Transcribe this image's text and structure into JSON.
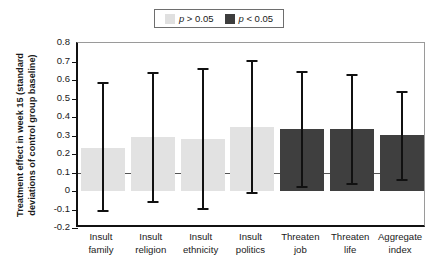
{
  "chart_data": {
    "type": "bar",
    "title": "",
    "xlabel": "",
    "ylabel": "Treatment effect in week 15 (standard deviations of control group baseline)",
    "ylabel_line1": "Treatment effect in week 15 (standard",
    "ylabel_line2": "deviations of control group baseline)",
    "ylim": [
      -0.2,
      0.8
    ],
    "yticks": [
      0.8,
      0.7,
      0.6,
      0.5,
      0.4,
      0.3,
      0.2,
      0.1,
      0,
      -0.1,
      -0.2
    ],
    "ytick_labels": [
      "0.8",
      "0.7",
      "0.6",
      "0.5",
      "0.4",
      "0.3",
      "0.2",
      "0.1",
      "0",
      "-0.1",
      "-0.2"
    ],
    "grid": false,
    "reference_line": 0.1,
    "categories": [
      "Insult family",
      "Insult religion",
      "Insult ethnicity",
      "Insult politics",
      "Threaten job",
      "Threaten life",
      "Aggregate index"
    ],
    "category_lines": [
      [
        "Insult",
        "family"
      ],
      [
        "Insult",
        "religion"
      ],
      [
        "Insult",
        "ethnicity"
      ],
      [
        "Insult",
        "politics"
      ],
      [
        "Threaten",
        "job"
      ],
      [
        "Threaten",
        "life"
      ],
      [
        "Aggregate",
        "index"
      ]
    ],
    "values": [
      0.235,
      0.29,
      0.283,
      0.345,
      0.335,
      0.333,
      0.303
    ],
    "ci_lower": [
      -0.115,
      -0.065,
      -0.1,
      -0.015,
      0.018,
      0.03,
      0.055
    ],
    "ci_upper": [
      0.59,
      0.645,
      0.665,
      0.71,
      0.65,
      0.63,
      0.54
    ],
    "significance": [
      "p > 0.05",
      "p > 0.05",
      "p > 0.05",
      "p > 0.05",
      "p < 0.05",
      "p < 0.05",
      "p < 0.05"
    ],
    "bar_styles": [
      "light",
      "light",
      "light",
      "light",
      "dark",
      "dark",
      "dark"
    ],
    "legend": {
      "position": "top-center",
      "entries": [
        {
          "label": "p > 0.05",
          "symbol": "p",
          "operator": "> 0.05",
          "style": "light",
          "color": "#e0e0e0"
        },
        {
          "label": "p < 0.05",
          "symbol": "p",
          "operator": "< 0.05",
          "style": "dark",
          "color": "#3d3d3d"
        }
      ]
    },
    "colors": {
      "light_bar": "#e2e2e2",
      "dark_bar": "#3f3f3f",
      "error_bar": "#111111",
      "reference_line": "#555555",
      "axis": "#111111",
      "background": "#ffffff"
    }
  }
}
